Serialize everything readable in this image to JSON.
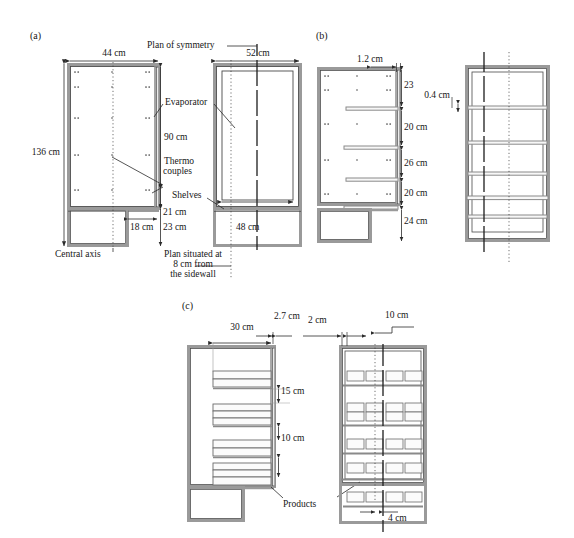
{
  "figure": {
    "type": "technical-drawing",
    "background": "#ffffff",
    "line_color": "#3b3b3b",
    "wall_color": "#8e8e8e",
    "dash_dot_color": "#2b2b2b"
  },
  "panels": [
    {
      "id": "a",
      "tag": "(a)",
      "views": [
        "side-section",
        "front-section"
      ],
      "labels": [
        "Plan of symmetry",
        "44 cm",
        "52 cm",
        "136 cm",
        "Evaporator",
        "90 cm",
        "Thermo",
        "couples",
        "Shelves",
        "21 cm",
        "18 cm",
        "23 cm",
        "48 cm",
        "Central axis",
        "Plan situated at",
        "8 cm from",
        "the sidewall"
      ],
      "dimensions": {
        "depth_side": "44 cm",
        "width_front": "52 cm",
        "total_height": "136 cm",
        "evaporator_height": "90 cm",
        "shelf_gap_bottom": "21 cm",
        "plinth_depth": "18 cm",
        "plinth_height": "23 cm",
        "inner_width": "48 cm"
      },
      "annotations": {
        "symmetry": "Plan of symmetry",
        "evaporator": "Evaporator",
        "thermocouples_l1": "Thermo",
        "thermocouples_l2": "couples",
        "shelves": "Shelves",
        "central_axis": "Central axis",
        "plan_note_l1": "Plan situated at",
        "plan_note_l2": "8 cm from",
        "plan_note_l3": "the sidewall"
      }
    },
    {
      "id": "b",
      "tag": "(b)",
      "views": [
        "side-section-shelves",
        "front-section-shelves"
      ],
      "labels": [
        "1.2 cm",
        "23",
        "20 cm",
        "26 cm",
        "20 cm",
        "24 cm",
        "0.4 cm"
      ],
      "dimensions": {
        "shelf_overhang": "1.2 cm",
        "gap_1": "23",
        "gap_2": "20 cm",
        "gap_3": "26 cm",
        "gap_4": "20 cm",
        "gap_5": "24 cm",
        "shelf_thickness": "0.4 cm"
      }
    },
    {
      "id": "c",
      "tag": "(c)",
      "views": [
        "side-section-products",
        "front-section-products"
      ],
      "labels": [
        "30 cm",
        "2.7 cm",
        "2 cm",
        "10 cm",
        "15 cm",
        "10 cm",
        "Products",
        "4 cm"
      ],
      "dimensions": {
        "product_depth": "30 cm",
        "front_clearance": "2.7 cm",
        "side_clearance": "2 cm",
        "product_width": "10 cm",
        "gap_top": "15 cm",
        "gap_mid": "10 cm",
        "center_gap": "4 cm"
      },
      "annotations": {
        "products": "Products"
      }
    }
  ],
  "text": {
    "tag_a": "(a)",
    "tag_b": "(b)",
    "tag_c": "(c)",
    "plan_of_symmetry": "Plan of symmetry",
    "d_44": "44 cm",
    "d_52": "52 cm",
    "d_136": "136 cm",
    "evaporator": "Evaporator",
    "d_90": "90 cm",
    "thermo": "Thermo",
    "couples": "couples",
    "shelves": "Shelves",
    "d_21": "21 cm",
    "d_18": "18 cm",
    "d_23": "23 cm",
    "d_48": "48 cm",
    "central_axis": "Central axis",
    "plan_note1": "Plan situated at",
    "plan_note2": "8 cm from",
    "plan_note3": "the sidewall",
    "d_12": "1.2 cm",
    "b_23": "23",
    "b_20a": "20 cm",
    "b_26": "26 cm",
    "b_20b": "20 cm",
    "b_24": "24 cm",
    "d_04": "0.4 cm",
    "c_30": "30 cm",
    "c_27": "2.7 cm",
    "c_2": "2 cm",
    "c_10top": "10 cm",
    "c_15": "15 cm",
    "c_10mid": "10 cm",
    "products": "Products",
    "c_4": "4 cm"
  }
}
